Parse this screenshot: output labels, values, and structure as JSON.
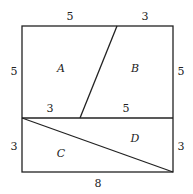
{
  "diagram": {
    "colors": {
      "stroke": "#222222",
      "background": "#ffffff"
    },
    "regions": [
      {
        "label": "A",
        "x": 61,
        "y": 72
      },
      {
        "label": "B",
        "x": 135,
        "y": 72
      },
      {
        "label": "C",
        "x": 61,
        "y": 157
      },
      {
        "label": "D",
        "x": 135,
        "y": 142
      }
    ],
    "edge_labels": [
      {
        "text": "5",
        "x": 70,
        "y": 20,
        "name": "top-left-length"
      },
      {
        "text": "3",
        "x": 145,
        "y": 20,
        "name": "top-right-length"
      },
      {
        "text": "5",
        "x": 14,
        "y": 75,
        "name": "left-upper-length"
      },
      {
        "text": "5",
        "x": 181,
        "y": 75,
        "name": "right-upper-length"
      },
      {
        "text": "3",
        "x": 50,
        "y": 112,
        "name": "middle-left-length"
      },
      {
        "text": "5",
        "x": 126,
        "y": 112,
        "name": "middle-right-length"
      },
      {
        "text": "3",
        "x": 14,
        "y": 150,
        "name": "left-lower-length"
      },
      {
        "text": "3",
        "x": 181,
        "y": 150,
        "name": "right-lower-length"
      },
      {
        "text": "8",
        "x": 98,
        "y": 187,
        "name": "bottom-length"
      }
    ]
  }
}
